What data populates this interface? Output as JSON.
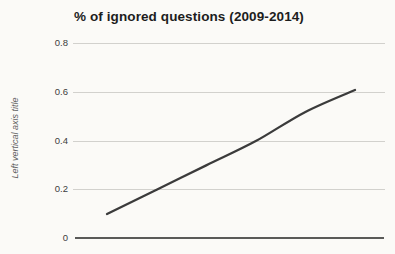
{
  "chart": {
    "title": "% of ignored questions (2009-2014)",
    "y_axis_title": "Left vertical axis title",
    "y_ticks": [
      "0.8",
      "0.6",
      "0.4",
      "0.2",
      "0"
    ],
    "colors": {
      "line": "#3b3b3b",
      "gridline": "#d2d1cd",
      "baseline": "#5a5a58",
      "title_text": "#1d1d1d",
      "tick_text": "#3c3c3c",
      "axis_title_text": "#5f5f5f",
      "background": "#fbfaf7"
    }
  },
  "chart_data": {
    "type": "line",
    "title": "% of ignored questions (2009-2014)",
    "x": [
      2009,
      2010,
      2011,
      2012,
      2013,
      2014
    ],
    "series": [
      {
        "name": "% of ignored questions",
        "values": [
          0.1,
          0.2,
          0.3,
          0.4,
          0.52,
          0.61
        ]
      }
    ],
    "xlabel": "",
    "ylabel": "Left vertical axis title",
    "ylim": [
      0,
      0.8
    ],
    "y_tick_step": 0.2,
    "grid": true,
    "legend_position": "none",
    "line_style": "smooth",
    "x_tick_labels_visible": false
  }
}
